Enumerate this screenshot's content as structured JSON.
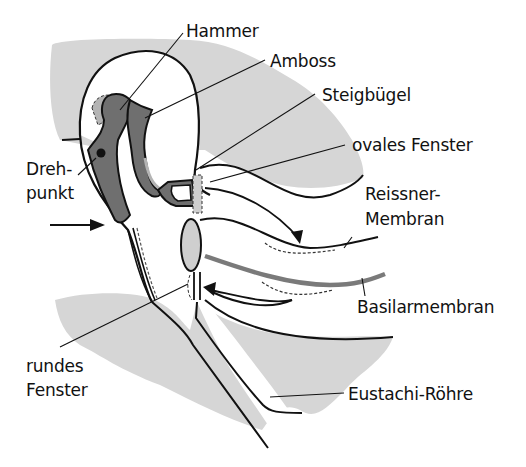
{
  "diagram": {
    "colors": {
      "bone_fill": "#6f6f6f",
      "bone_shadow": "#b4b4b4",
      "tissue_fill": "#d6d6d6",
      "outline": "#111111",
      "basilar_membrane": "#7a7a7a",
      "window_fill": "#cfcfcf"
    },
    "labels": {
      "hammer": "Hammer",
      "amboss": "Amboss",
      "steigbuegel": "Steigbügel",
      "ovales_fenster": "ovales Fenster",
      "reissner_1": "Reissner-",
      "reissner_2": "Membran",
      "basilarmembran": "Basilarmembran",
      "drehpunkt_1": "Dreh-",
      "drehpunkt_2": "punkt",
      "rundes_1": "rundes",
      "rundes_2": "Fenster",
      "eustachi": "Eustachi-Röhre"
    },
    "arrows": [
      {
        "name": "sound-input-arrow",
        "direction": "right"
      },
      {
        "name": "pressure-wave-arrow-scala-vestibuli",
        "direction": "down-right"
      },
      {
        "name": "pressure-wave-arrow-round-window",
        "direction": "left"
      }
    ]
  }
}
